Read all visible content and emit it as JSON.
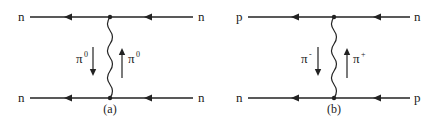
{
  "diagrams": [
    {
      "caption": "(a)",
      "top_left": "n",
      "top_right": "n",
      "bottom_left": "n",
      "bottom_right": "n",
      "exchange_down": {
        "symbol": "π",
        "charge": "0"
      },
      "exchange_up": {
        "symbol": "π",
        "charge": "0"
      }
    },
    {
      "caption": "(b)",
      "top_left": "p",
      "top_right": "n",
      "bottom_left": "n",
      "bottom_right": "p",
      "exchange_down": {
        "symbol": "π",
        "charge": "-"
      },
      "exchange_up": {
        "symbol": "π",
        "charge": "+"
      }
    }
  ],
  "colors": {
    "line": "#222222",
    "background": "#ffffff"
  }
}
